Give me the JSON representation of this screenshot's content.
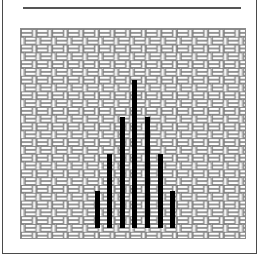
{
  "figure": {
    "border_color": "#4a4a4a",
    "background_color": "#ffffff",
    "rule_color": "#555555",
    "panel_border_color": "#8c8c8c",
    "weave_line_color": "#7a7a7a",
    "weave_fill_color": "#fbfbfb",
    "bar_color": "#000000"
  },
  "chart_data": {
    "type": "bar",
    "title": "",
    "subtitle": "",
    "xlabel": "",
    "ylabel": "",
    "grid": false,
    "legend": "none",
    "fill_pattern": "basketweave",
    "bar_color": "#000000",
    "categories": [
      "1",
      "2",
      "3",
      "4",
      "5",
      "6",
      "7"
    ],
    "values": [
      3,
      6,
      9,
      12,
      9,
      6,
      3
    ],
    "ylim": [
      0,
      13
    ],
    "xlim": [
      0,
      8
    ],
    "annotations": []
  }
}
